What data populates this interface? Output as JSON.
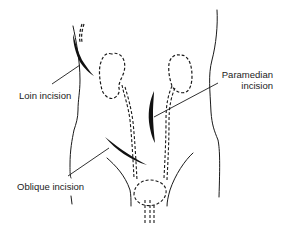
{
  "diagram": {
    "labels": {
      "loin": "Loin incision",
      "paramedian_line1": "Paramedian",
      "paramedian_line2": "incision",
      "oblique": "Oblique incision"
    },
    "colors": {
      "ink": "#1a1a1a",
      "background": "#ffffff"
    },
    "structures": [
      "body-outline",
      "left-kidney",
      "right-kidney",
      "left-ureter",
      "right-ureter",
      "bladder",
      "urethra"
    ],
    "incisions": [
      "loin-incision",
      "paramedian-incision",
      "oblique-incision"
    ]
  }
}
